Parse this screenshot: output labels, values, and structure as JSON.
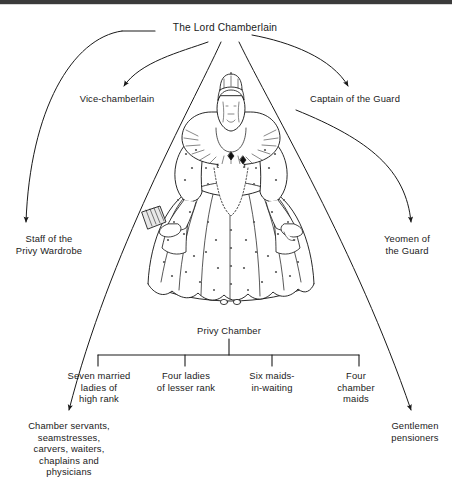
{
  "page": {
    "type": "organisational-chart",
    "background_color": "#ffffff",
    "line_color": "#1a1a1a",
    "text_color": "#1a1a1a",
    "top_rule_color": "#3b3b3b"
  },
  "nodes": {
    "lord_chamberlain": "The Lord Chamberlain",
    "vice_chamberlain": "Vice-chamberlain",
    "captain_of_the_guard": "Captain of the Guard",
    "staff_of_the_privy_wardrobe": "Staff of the\nPrivy Wardrobe",
    "yeomen_of_the_guard": "Yeomen of\nthe Guard",
    "privy_chamber": "Privy Chamber",
    "seven_married_ladies": "Seven married\nladies of\nhigh rank",
    "four_ladies_lesser_rank": "Four ladies\nof lesser rank",
    "six_maids_in_waiting": "Six maids-\nin-waiting",
    "four_chamber_maids": "Four\nchamber\nmaids",
    "chamber_servants": "Chamber servants,\nseamstresses,\ncarvers, waiters,\nchaplains and\nphysicians",
    "gentlemen_pensioners": "Gentlemen\npensioners"
  },
  "illustration": {
    "name": "queen-elizabeth-figure",
    "description": "Line drawing of Queen Elizabeth I in a jewelled farthingale gown with lace ruff, crown and feather fan"
  },
  "connectors": [
    {
      "from": "lord_chamberlain",
      "to": "staff_of_the_privy_wardrobe",
      "style": "curved-arrow"
    },
    {
      "from": "lord_chamberlain",
      "to": "vice_chamberlain",
      "style": "curved-arrow"
    },
    {
      "from": "lord_chamberlain",
      "to": "chamber_servants",
      "style": "curved-arrow"
    },
    {
      "from": "lord_chamberlain",
      "to": "gentlemen_pensioners",
      "style": "curved-arrow"
    },
    {
      "from": "lord_chamberlain",
      "to": "captain_of_the_guard",
      "style": "curved-arrow"
    },
    {
      "from": "lord_chamberlain",
      "to": "yeomen_of_the_guard",
      "style": "curved-arrow"
    },
    {
      "from": "privy_chamber",
      "to": "seven_married_ladies",
      "style": "bracket"
    },
    {
      "from": "privy_chamber",
      "to": "four_ladies_lesser_rank",
      "style": "bracket"
    },
    {
      "from": "privy_chamber",
      "to": "six_maids_in_waiting",
      "style": "bracket"
    },
    {
      "from": "privy_chamber",
      "to": "four_chamber_maids",
      "style": "bracket"
    }
  ]
}
